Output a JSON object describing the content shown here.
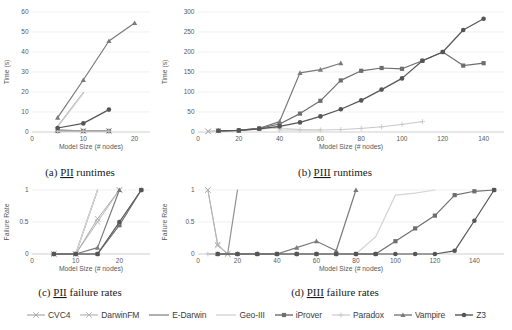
{
  "figure": {
    "axis_titles": {
      "time": "Time (s)",
      "failure": "Failure Rate",
      "model_size": "Model Size (# nodes)"
    }
  },
  "series_styles": [
    {
      "name": "CVC4",
      "color": "#a9a9a9",
      "marker": "x",
      "width": 1.0
    },
    {
      "name": "DarwinFM",
      "color": "#b5b5b5",
      "marker": "x",
      "width": 1.0
    },
    {
      "name": "E-Darwin",
      "color": "#8f8f8f",
      "marker": "none",
      "width": 1.2
    },
    {
      "name": "Geo-III",
      "color": "#d4d4d4",
      "marker": "none",
      "width": 1.2
    },
    {
      "name": "iProver",
      "color": "#6e6e6e",
      "marker": "square",
      "width": 1.2
    },
    {
      "name": "Paradox",
      "color": "#c9c9c9",
      "marker": "plus",
      "width": 1.0
    },
    {
      "name": "Vampire",
      "color": "#7a7a7a",
      "marker": "triangle",
      "width": 1.2
    },
    {
      "name": "Z3",
      "color": "#555555",
      "marker": "circle",
      "width": 1.2
    }
  ],
  "legend": {
    "items": [
      {
        "label": "CVC4"
      },
      {
        "label": "DarwinFM"
      },
      {
        "label": "E-Darwin"
      },
      {
        "label": "Geo-III"
      },
      {
        "label": "iProver"
      },
      {
        "label": "Paradox"
      },
      {
        "label": "Vampire"
      },
      {
        "label": "Z3"
      }
    ]
  },
  "chart_data": [
    {
      "id": "a",
      "type": "line",
      "caption_prefix": "(a) ",
      "caption_underlined": "PII",
      "caption_suffix": " runtimes",
      "title": "",
      "xlabel": "Model Size (# nodes)",
      "ylabel": "Time (s)",
      "xlim": [
        0,
        23
      ],
      "ylim": [
        0,
        60
      ],
      "xticks": [
        0,
        10,
        20
      ],
      "yticks": [
        0,
        10,
        20,
        30,
        40,
        50,
        60
      ],
      "grid": true,
      "legend_position": "below-figure",
      "series": [
        {
          "name": "CVC4",
          "x": [
            5,
            10,
            15
          ],
          "y": [
            1.0,
            0.6,
            0.6
          ]
        },
        {
          "name": "DarwinFM",
          "x": [
            5,
            10,
            15
          ],
          "y": [
            1.2,
            0.5,
            0.4
          ]
        },
        {
          "name": "E-Darwin",
          "x": [
            5,
            10
          ],
          "y": [
            2.8,
            19.6
          ]
        },
        {
          "name": "Geo-III",
          "x": [
            5,
            10
          ],
          "y": [
            2.6,
            19.4
          ]
        },
        {
          "name": "iProver",
          "x": [
            5,
            10,
            15
          ],
          "y": [
            0.5,
            0.5,
            0.5
          ]
        },
        {
          "name": "Paradox",
          "x": [
            5,
            10,
            15
          ],
          "y": [
            0.4,
            0.4,
            0.4
          ]
        },
        {
          "name": "Vampire",
          "x": [
            5,
            10,
            15,
            20
          ],
          "y": [
            7.2,
            26.0,
            45.5,
            54.5
          ]
        },
        {
          "name": "Z3",
          "x": [
            5,
            10,
            15
          ],
          "y": [
            2.0,
            4.3,
            11.2
          ]
        }
      ]
    },
    {
      "id": "b",
      "type": "line",
      "caption_prefix": "(b) ",
      "caption_underlined": "PIII",
      "caption_suffix": " runtimes",
      "title": "",
      "xlabel": "Model Size (# nodes)",
      "ylabel": "Time (s)",
      "xlim": [
        0,
        150
      ],
      "ylim": [
        0,
        300
      ],
      "xticks": [
        0,
        20,
        40,
        60,
        80,
        100,
        120,
        140
      ],
      "yticks": [
        0,
        50,
        100,
        150,
        200,
        250,
        300
      ],
      "grid": true,
      "legend_position": "below-figure",
      "series": [
        {
          "name": "CVC4",
          "x": [
            5
          ],
          "y": [
            1
          ]
        },
        {
          "name": "DarwinFM",
          "x": [
            5,
            10
          ],
          "y": [
            2,
            3
          ]
        },
        {
          "name": "E-Darwin",
          "x": [
            10,
            20,
            30,
            40
          ],
          "y": [
            3,
            4,
            8,
            12
          ]
        },
        {
          "name": "Geo-III",
          "x": [
            10,
            20,
            30,
            40,
            50,
            60
          ],
          "y": [
            3,
            4,
            7,
            10,
            6,
            5
          ]
        },
        {
          "name": "iProver",
          "x": [
            10,
            20,
            30,
            40,
            50,
            60,
            70,
            80,
            90,
            100,
            110,
            120,
            130,
            140
          ],
          "y": [
            3,
            4,
            9,
            20,
            46,
            78,
            129,
            153,
            160,
            158,
            178,
            200,
            166,
            172
          ]
        },
        {
          "name": "Paradox",
          "x": [
            40,
            50,
            60,
            70,
            80,
            90,
            100,
            110
          ],
          "y": [
            5,
            5,
            5,
            6,
            9,
            13,
            19,
            26
          ]
        },
        {
          "name": "Vampire",
          "x": [
            10,
            20,
            30,
            40,
            50,
            60,
            70
          ],
          "y": [
            3,
            4,
            9,
            26,
            148,
            156,
            172
          ]
        },
        {
          "name": "Z3",
          "x": [
            10,
            20,
            30,
            40,
            50,
            60,
            70,
            80,
            90,
            100,
            110,
            120,
            130,
            140
          ],
          "y": [
            3,
            4,
            8,
            14,
            24,
            39,
            57,
            79,
            106,
            134,
            178,
            200,
            255,
            283
          ]
        }
      ]
    },
    {
      "id": "c",
      "type": "line",
      "caption_prefix": "(c) ",
      "caption_underlined": "PII",
      "caption_suffix": " failure rates",
      "title": "",
      "xlabel": "Model Size (# nodes)",
      "ylabel": "Failure Rate",
      "xlim": [
        0,
        27
      ],
      "ylim": [
        0,
        1
      ],
      "xticks": [
        0,
        10,
        20
      ],
      "yticks": [
        0,
        0.5,
        1
      ],
      "grid": true,
      "legend_position": "below-figure",
      "series": [
        {
          "name": "CVC4",
          "x": [
            5,
            10,
            15,
            20
          ],
          "y": [
            0,
            0,
            0.55,
            1
          ]
        },
        {
          "name": "DarwinFM",
          "x": [
            5,
            10,
            15,
            20
          ],
          "y": [
            0,
            0,
            0.5,
            1
          ]
        },
        {
          "name": "E-Darwin",
          "x": [
            5,
            10,
            15
          ],
          "y": [
            0,
            0,
            1
          ]
        },
        {
          "name": "Geo-III",
          "x": [
            5,
            10,
            15
          ],
          "y": [
            0,
            0,
            1
          ]
        },
        {
          "name": "iProver",
          "x": [
            5,
            10,
            15,
            20,
            25
          ],
          "y": [
            0,
            0,
            0,
            0.45,
            1
          ]
        },
        {
          "name": "Paradox",
          "x": [
            5,
            10,
            15,
            20,
            25
          ],
          "y": [
            0,
            0,
            0,
            0.5,
            1
          ]
        },
        {
          "name": "Vampire",
          "x": [
            5,
            10,
            15,
            20
          ],
          "y": [
            0,
            0,
            0.1,
            1
          ]
        },
        {
          "name": "Z3",
          "x": [
            5,
            10,
            15,
            20,
            25
          ],
          "y": [
            0,
            0,
            0,
            0.5,
            1
          ]
        }
      ]
    },
    {
      "id": "d",
      "type": "line",
      "caption_prefix": "(d) ",
      "caption_underlined": "PIII",
      "caption_suffix": " failure rates",
      "title": "",
      "xlabel": "Model Size (# nodes)",
      "ylabel": "Failure Rate",
      "xlim": [
        0,
        155
      ],
      "ylim": [
        0,
        1
      ],
      "xticks": [
        0,
        20,
        40,
        60,
        80,
        100,
        120,
        140
      ],
      "yticks": [
        0,
        0.5,
        1
      ],
      "grid": true,
      "legend_position": "below-figure",
      "series": [
        {
          "name": "CVC4",
          "x": [
            5,
            10,
            15
          ],
          "y": [
            1,
            0.15,
            0
          ]
        },
        {
          "name": "DarwinFM",
          "x": [
            5,
            10,
            15
          ],
          "y": [
            1,
            0.13,
            0
          ]
        },
        {
          "name": "E-Darwin",
          "x": [
            5,
            10,
            15,
            20
          ],
          "y": [
            0,
            0,
            0,
            1
          ]
        },
        {
          "name": "Geo-III",
          "x": [
            70,
            80,
            90,
            100,
            110,
            120
          ],
          "y": [
            0,
            0,
            0.27,
            0.92,
            0.95,
            1
          ]
        },
        {
          "name": "iProver",
          "x": [
            10,
            20,
            30,
            40,
            50,
            60,
            70,
            80,
            90,
            100,
            110,
            120,
            130,
            140,
            150
          ],
          "y": [
            0,
            0,
            0,
            0,
            0,
            0,
            0,
            0,
            0,
            0.2,
            0.4,
            0.6,
            0.92,
            0.98,
            1
          ]
        },
        {
          "name": "Paradox",
          "x": [
            5,
            10,
            20,
            30,
            40,
            50,
            60,
            70,
            80
          ],
          "y": [
            0,
            0,
            0,
            0,
            0,
            0,
            0,
            0,
            0
          ]
        },
        {
          "name": "Vampire",
          "x": [
            10,
            20,
            30,
            40,
            50,
            60,
            70,
            80
          ],
          "y": [
            0,
            0,
            0,
            0,
            0.1,
            0.2,
            0.05,
            1
          ]
        },
        {
          "name": "Z3",
          "x": [
            10,
            20,
            30,
            40,
            50,
            60,
            70,
            80,
            90,
            100,
            110,
            120,
            130,
            140,
            150
          ],
          "y": [
            0,
            0,
            0,
            0,
            0,
            0,
            0,
            0,
            0,
            0,
            0,
            0,
            0.05,
            0.52,
            1
          ]
        }
      ]
    }
  ]
}
